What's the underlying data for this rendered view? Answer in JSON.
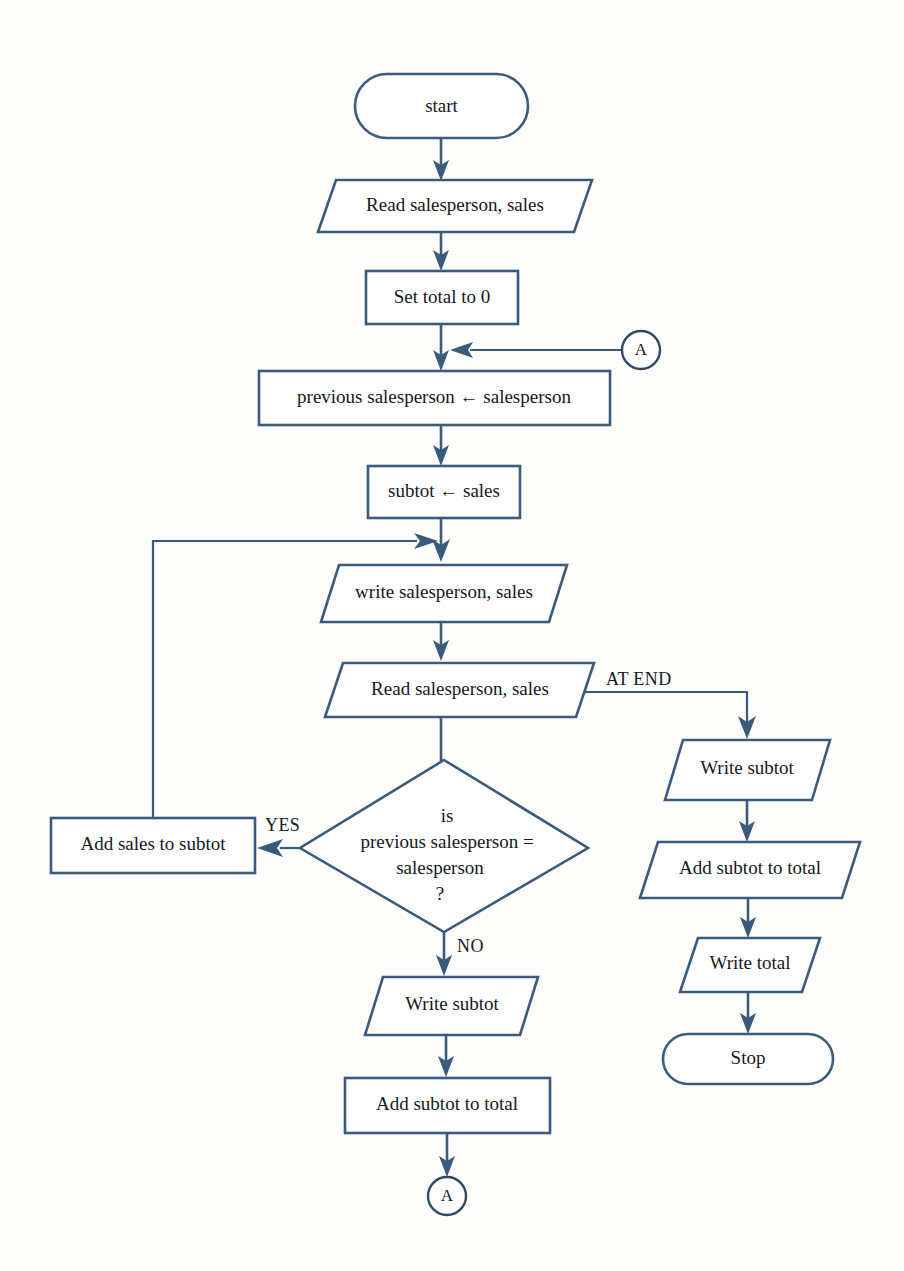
{
  "diagram": {
    "colors": {
      "stroke": "#3a5b7c",
      "text": "#14181c",
      "background": "#fdfdfc"
    },
    "nodes": {
      "start": {
        "label": "start",
        "shape": "terminator"
      },
      "read_first": {
        "label": "Read salesperson, sales",
        "shape": "parallelogram"
      },
      "set_total": {
        "label": "Set total to 0",
        "shape": "rectangle"
      },
      "prev_assign": {
        "label": "previous salesperson ← salesperson",
        "shape": "rectangle"
      },
      "subtot_assign": {
        "label": "subtot ← sales",
        "shape": "rectangle"
      },
      "write_rec": {
        "label": "write salesperson, sales",
        "shape": "parallelogram"
      },
      "read_next": {
        "label": "Read salesperson, sales",
        "shape": "parallelogram"
      },
      "decision": {
        "shape": "diamond",
        "lines": [
          "is",
          "previous salesperson  =",
          "salesperson",
          "?"
        ]
      },
      "add_sales": {
        "label": "Add sales to subtot",
        "shape": "rectangle"
      },
      "write_subtot_no": {
        "label": "Write subtot",
        "shape": "parallelogram"
      },
      "add_subtot_no": {
        "label": "Add subtot to total",
        "shape": "rectangle"
      },
      "write_subtot_end": {
        "label": "Write subtot",
        "shape": "parallelogram"
      },
      "add_subtot_end": {
        "label": "Add subtot to total",
        "shape": "parallelogram"
      },
      "write_total_end": {
        "label": "Write total",
        "shape": "parallelogram"
      },
      "stop": {
        "label": "Stop",
        "shape": "terminator"
      }
    },
    "connectors": {
      "a_in": {
        "label": "A",
        "shape": "circle"
      },
      "a_out": {
        "label": "A",
        "shape": "circle"
      }
    },
    "edge_labels": {
      "at_end": "AT END",
      "yes": "YES",
      "no": "NO"
    }
  }
}
